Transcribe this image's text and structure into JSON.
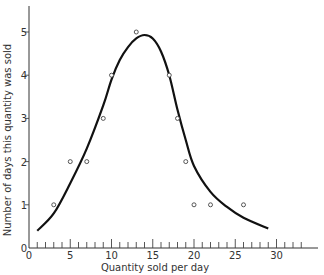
{
  "chart_data": {
    "type": "scatter",
    "title": "",
    "xlabel": "Quantity sold per day",
    "ylabel": "Number of days this quantity was sold",
    "xlim": [
      0,
      34
    ],
    "ylim": [
      0,
      5.5
    ],
    "xticks": [
      0,
      5,
      10,
      15,
      20,
      25,
      30
    ],
    "yticks": [
      0,
      1,
      2,
      3,
      4,
      5
    ],
    "minor_xticks_every": 1,
    "grid": false,
    "legend": null,
    "series": [
      {
        "name": "observed",
        "type": "scatter",
        "marker": "open-circle",
        "x": [
          3,
          5,
          7,
          9,
          10,
          13,
          17,
          18,
          19,
          20,
          22,
          26
        ],
        "y": [
          1,
          2,
          2,
          3,
          4,
          5,
          4,
          3,
          2,
          1,
          1,
          1
        ]
      },
      {
        "name": "fitted curve",
        "type": "line",
        "style": "smooth bell-shaped curve",
        "x": [
          1,
          3,
          5,
          7,
          9,
          10,
          11,
          12,
          13,
          14,
          15,
          16,
          17,
          18,
          19,
          20,
          22,
          24,
          26,
          29
        ],
        "y": [
          0.4,
          0.8,
          1.5,
          2.3,
          3.3,
          3.9,
          4.35,
          4.65,
          4.85,
          4.93,
          4.85,
          4.55,
          4.0,
          3.2,
          2.5,
          1.9,
          1.3,
          0.95,
          0.7,
          0.45
        ]
      }
    ]
  }
}
